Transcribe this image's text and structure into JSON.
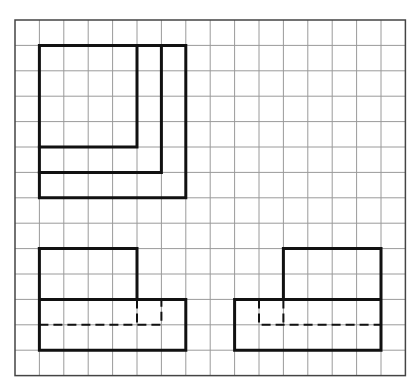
{
  "diagram": {
    "type": "orthographic-projection-three-views",
    "grid": {
      "origin_x": 15,
      "origin_y": 20,
      "cols": 16,
      "rows": 14,
      "cell_w": 24.4,
      "cell_h": 25.4,
      "line_color": "#9a9a9a",
      "border_color": "#444444"
    },
    "stroke_color": "#111111",
    "views": [
      {
        "name": "top-view",
        "solid": [
          [
            [
              1,
              1
            ],
            [
              7,
              1
            ],
            [
              7,
              7
            ],
            [
              1,
              7
            ],
            [
              1,
              1
            ]
          ],
          [
            [
              6,
              1
            ],
            [
              6,
              6
            ],
            [
              1,
              6
            ]
          ],
          [
            [
              5,
              1
            ],
            [
              5,
              5
            ],
            [
              1,
              5
            ]
          ]
        ],
        "dashed": []
      },
      {
        "name": "front-view",
        "solid": [
          [
            [
              1,
              9
            ],
            [
              5,
              9
            ],
            [
              5,
              11
            ]
          ],
          [
            [
              1,
              9
            ],
            [
              1,
              13
            ],
            [
              7,
              13
            ],
            [
              7,
              11
            ],
            [
              1,
              11
            ]
          ]
        ],
        "dashed": [
          [
            [
              1,
              12
            ],
            [
              6,
              12
            ],
            [
              6,
              11
            ]
          ],
          [
            [
              5,
              11
            ],
            [
              5,
              12
            ]
          ]
        ]
      },
      {
        "name": "side-view",
        "solid": [
          [
            [
              11,
              11
            ],
            [
              11,
              9
            ],
            [
              15,
              9
            ],
            [
              15,
              13
            ],
            [
              9,
              13
            ],
            [
              9,
              11
            ],
            [
              15,
              11
            ]
          ]
        ],
        "dashed": [
          [
            [
              10,
              11
            ],
            [
              10,
              12
            ],
            [
              15,
              12
            ]
          ],
          [
            [
              11,
              11
            ],
            [
              11,
              12
            ]
          ]
        ]
      }
    ]
  }
}
